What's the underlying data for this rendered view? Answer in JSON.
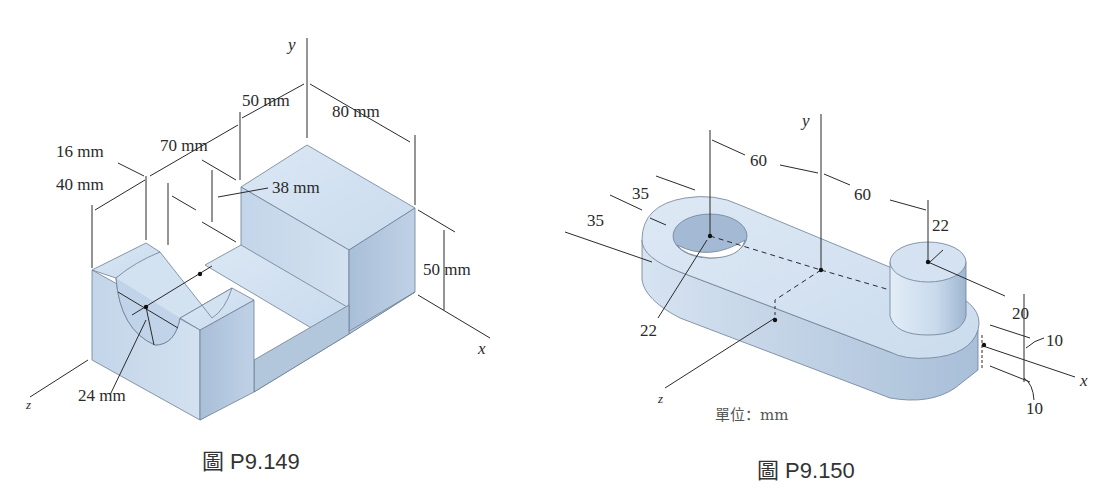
{
  "figures": [
    {
      "id": "P9.149",
      "caption": "圖 P9.149",
      "axes": {
        "x": "x",
        "y": "y",
        "z": "z"
      },
      "dimensions": {
        "d50top": "50 mm",
        "d80": "80 mm",
        "d70": "70 mm",
        "d16": "16 mm",
        "d40": "40 mm",
        "d38": "38 mm",
        "d50right": "50 mm",
        "d24": "24 mm"
      }
    },
    {
      "id": "P9.150",
      "caption": "圖 P9.150",
      "units_note": "單位：mm",
      "axes": {
        "x": "x",
        "y": "y",
        "z": "z"
      },
      "dimensions": {
        "d60left": "60",
        "d60right": "60",
        "d35upper": "35",
        "d35lower": "35",
        "d22hole": "22",
        "d22boss": "22",
        "d20": "20",
        "d10upper": "10",
        "d10lower": "10"
      }
    }
  ],
  "colors": {
    "face_top": "#d6e4f2",
    "face_front": "#b4c8de",
    "face_side": "#c5d6e8",
    "line": "#2a2a2a"
  }
}
